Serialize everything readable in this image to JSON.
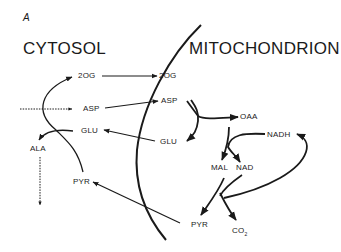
{
  "panel_label": "A",
  "compartments": {
    "cytosol": "CYTOSOL",
    "mitochondrion": "MITOCHONDRION"
  },
  "cytosol_metabolites": {
    "og": "2OG",
    "asp": "ASP",
    "glu": "GLU",
    "ala": "ALA",
    "pyr": "PYR"
  },
  "mito_metabolites": {
    "og": "2OG",
    "asp": "ASP",
    "glu": "GLU",
    "oaa": "OAA",
    "nadh": "NADH",
    "mal": "MAL",
    "nad": "NAD",
    "pyr": "PYR",
    "co2": "CO",
    "co2_sub": "2"
  },
  "colors": {
    "ink": "#1a1a1a",
    "background": "#ffffff"
  }
}
